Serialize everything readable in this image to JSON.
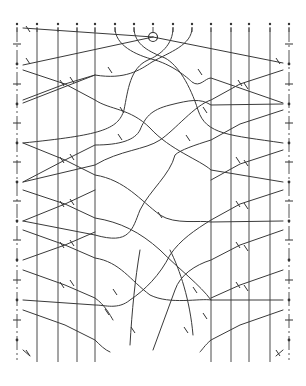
{
  "diagram": {
    "title": "",
    "stroke_color": "#3a3a3a",
    "background": "#ffffff",
    "columns_x": [
      17,
      37,
      58,
      77,
      95,
      115,
      134,
      153,
      173,
      192,
      211,
      231,
      249,
      270,
      289
    ],
    "column_top_y": 24,
    "vertical_lines": [
      {
        "x": 37,
        "y1": 28,
        "y2": 362
      },
      {
        "x": 58,
        "y1": 28,
        "y2": 362
      },
      {
        "x": 77,
        "y1": 28,
        "y2": 362
      },
      {
        "x": 95,
        "y1": 28,
        "y2": 362
      },
      {
        "x": 211,
        "y1": 28,
        "y2": 362
      },
      {
        "x": 231,
        "y1": 28,
        "y2": 362
      },
      {
        "x": 249,
        "y1": 28,
        "y2": 362
      },
      {
        "x": 270,
        "y1": 28,
        "y2": 362
      }
    ],
    "edges": [
      {
        "side": "left",
        "x": 17,
        "y1": 28,
        "y2": 360
      },
      {
        "side": "right",
        "x": 289,
        "y1": 28,
        "y2": 360
      }
    ],
    "edge_pins_y": [
      64,
      104,
      143,
      182,
      221,
      260,
      300,
      340
    ],
    "start_pin": {
      "x": 153,
      "y": 37,
      "r": 4.5
    },
    "paths": [
      "M23 28 L153 37",
      "M23 65 L153 37",
      "M153 37 L283 63",
      "M115 28 C115 45 135 55 155 60 C175 66 190 80 192 82 C200 88 205 78 211 78 L283 103",
      "M134 28 C134 45 150 52 165 58 C178 65 190 85 198 110 C206 135 230 135 283 143",
      "M173 28 C173 45 160 55 148 60 C130 68 128 90 124 110 C118 130 100 135 23 143",
      "M192 28 C192 45 170 52 152 62 C140 70 125 80 95 75 L23 103",
      "M23 70 L65 84 L95 100 C110 110 130 108 150 128 C170 150 200 160 211 170 L283 182",
      "M23 100 L65 84 L95 75",
      "M23 143 L65 160 L95 175 C125 180 140 200 160 215 C175 225 200 220 211 222 L283 221",
      "M23 182 L65 160 L95 145 C120 145 135 140 140 130 C145 118 150 110 170 105 C190 100 200 98 211 105 L283 104",
      "M283 70 L240 84 L211 100 C195 105 175 130 160 140 C145 150 120 150 95 165 L23 182",
      "M283 110 L240 124 L211 140 C195 145 180 150 175 155 C170 175 150 190 140 210 C132 230 130 245 95 235 L23 221",
      "M23 190 L65 204 L95 218 C120 222 140 232 160 250 C180 270 200 285 211 300 L283 300",
      "M23 221 L65 204 L95 190",
      "M23 230 L65 245 L95 258 C120 262 130 280 150 295 C170 305 200 298 211 300",
      "M23 260 L65 245 L95 232",
      "M283 190 L240 204 L211 220 C195 230 180 240 170 255 C160 275 145 290 130 300 C118 310 105 305 95 305 L23 300",
      "M283 230 L240 245 L211 260 C195 265 180 275 175 290 C168 310 160 330 153 350",
      "M283 150 L240 164 L211 180",
      "M23 270 L65 285 L95 298 C105 305 110 315 113 320",
      "M23 310 L65 325 L95 340 C100 345 105 350 110 352",
      "M23 350 L30 356",
      "M283 270 L240 285 L211 298",
      "M283 310 L240 325 L211 340 C205 345 202 350 200 352",
      "M283 350 L276 356",
      "M170 250 C180 270 190 300 193 335",
      "M140 250 C135 280 132 310 130 345"
    ],
    "tick_marks": [
      {
        "x": 28,
        "y": 29
      },
      {
        "x": 28,
        "y": 61
      },
      {
        "x": 278,
        "y": 61
      },
      {
        "x": 62,
        "y": 83
      },
      {
        "x": 72,
        "y": 80
      },
      {
        "x": 240,
        "y": 83
      },
      {
        "x": 246,
        "y": 86
      },
      {
        "x": 110,
        "y": 70
      },
      {
        "x": 122,
        "y": 110
      },
      {
        "x": 200,
        "y": 72
      },
      {
        "x": 205,
        "y": 110
      },
      {
        "x": 62,
        "y": 160
      },
      {
        "x": 72,
        "y": 157
      },
      {
        "x": 238,
        "y": 160
      },
      {
        "x": 246,
        "y": 163
      },
      {
        "x": 120,
        "y": 137
      },
      {
        "x": 188,
        "y": 138
      },
      {
        "x": 160,
        "y": 215
      },
      {
        "x": 62,
        "y": 204
      },
      {
        "x": 72,
        "y": 202
      },
      {
        "x": 238,
        "y": 204
      },
      {
        "x": 246,
        "y": 206
      },
      {
        "x": 62,
        "y": 245
      },
      {
        "x": 72,
        "y": 243
      },
      {
        "x": 238,
        "y": 245
      },
      {
        "x": 246,
        "y": 248
      },
      {
        "x": 62,
        "y": 285
      },
      {
        "x": 72,
        "y": 283
      },
      {
        "x": 238,
        "y": 285
      },
      {
        "x": 246,
        "y": 288
      },
      {
        "x": 115,
        "y": 292
      },
      {
        "x": 195,
        "y": 290
      },
      {
        "x": 107,
        "y": 312
      },
      {
        "x": 205,
        "y": 316
      },
      {
        "x": 133,
        "y": 330
      },
      {
        "x": 186,
        "y": 330
      },
      {
        "x": 28,
        "y": 353
      },
      {
        "x": 278,
        "y": 353
      }
    ]
  }
}
